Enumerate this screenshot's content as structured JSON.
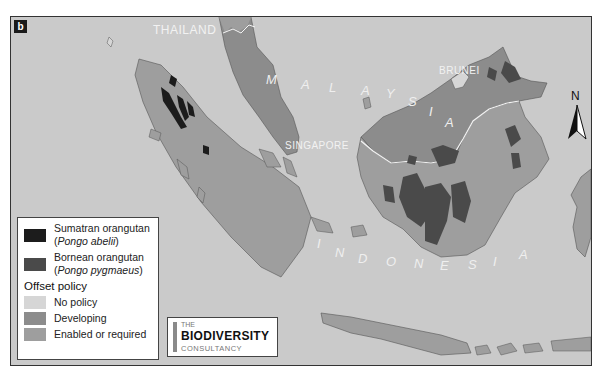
{
  "panel_label": "b",
  "map": {
    "country_labels": {
      "thailand": "THAILAND",
      "malaysia": [
        "M",
        "A",
        "L",
        "A",
        "Y",
        "S",
        "I",
        "A"
      ],
      "brunei": "BRUNEI",
      "singapore": "SINGAPORE",
      "indonesia": [
        "I",
        "N",
        "D",
        "O",
        "N",
        "E",
        "S",
        "I",
        "A"
      ]
    },
    "north_arrow": "N",
    "colors": {
      "sea": "#cacaca",
      "no_policy": "#d6d6d6",
      "developing": "#8c8c8c",
      "enabled_or_required": "#9e9e9e",
      "sumatran_orangutan": "#1c1c1c",
      "bornean_orangutan": "#4a4a4a",
      "border_line": "#f4f4f4"
    }
  },
  "legend": {
    "species": [
      {
        "name": "Sumatran orangutan",
        "latin": "Pongo abelii",
        "color": "#1c1c1c"
      },
      {
        "name": "Bornean orangutan",
        "latin": "Pongo pygmaeus",
        "color": "#4a4a4a"
      }
    ],
    "policy_title": "Offset policy",
    "policies": [
      {
        "label": "No policy",
        "color": "#d6d6d6"
      },
      {
        "label": "Developing",
        "color": "#8c8c8c"
      },
      {
        "label": "Enabled or required",
        "color": "#9e9e9e"
      }
    ]
  },
  "logo": {
    "the": "THE",
    "name": "BIODIVERSITY",
    "sub": "CONSULTANCY"
  }
}
